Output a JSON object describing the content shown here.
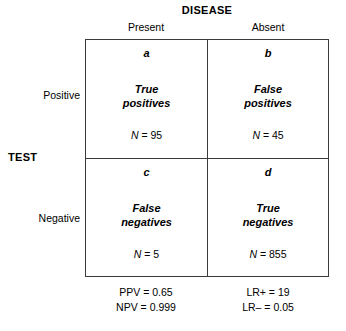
{
  "figure": {
    "type": "2x2-contingency-table",
    "column_group_title": "DISEASE",
    "row_group_title": "TEST",
    "column_headers": [
      "Present",
      "Absent"
    ],
    "row_headers": [
      "Positive",
      "Negative"
    ]
  },
  "cells": {
    "a": {
      "letter": "a",
      "label_line1": "True",
      "label_line2": "positives",
      "count_var": "N",
      "count_text": "= 95",
      "count_value": 95
    },
    "b": {
      "letter": "b",
      "label_line1": "False",
      "label_line2": "positives",
      "count_var": "N",
      "count_text": "= 45",
      "count_value": 45
    },
    "c": {
      "letter": "c",
      "label_line1": "False",
      "label_line2": "negatives",
      "count_var": "N",
      "count_text": "= 5",
      "count_value": 5
    },
    "d": {
      "letter": "d",
      "label_line1": "True",
      "label_line2": "negatives",
      "count_var": "N",
      "count_text": "= 855",
      "count_value": 855
    }
  },
  "stats": {
    "left": [
      {
        "name": "PPV",
        "text": "PPV = 0.65",
        "value": 0.65
      },
      {
        "name": "NPV",
        "text": "NPV = 0.999",
        "value": 0.999
      }
    ],
    "right": [
      {
        "name": "LR+",
        "text": "LR+ = 19",
        "value": 19
      },
      {
        "name": "LR-",
        "text": "LR– = 0.05",
        "value": 0.05
      }
    ]
  },
  "colors": {
    "background": "#ffffff",
    "text": "#000000",
    "border": "#3b3b3b"
  }
}
